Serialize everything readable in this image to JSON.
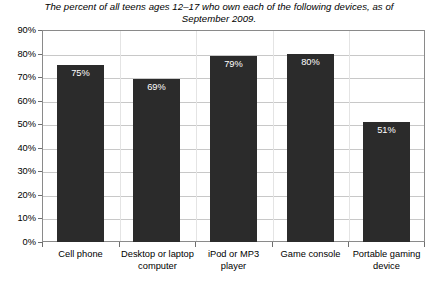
{
  "chart_data": {
    "type": "bar",
    "title": "The percent of all teens ages 12–17 who own each of the following devices, as of September 2009.",
    "xlabel": "",
    "ylabel": "",
    "ylim": [
      0,
      90
    ],
    "ytick_step": 10,
    "grid": true,
    "legend": "none",
    "orientation": "vertical",
    "bar_color": "#2b2b2b",
    "value_label_color": "#ffffff",
    "categories": [
      "Cell phone",
      "Desktop or laptop computer",
      "iPod or MP3 player",
      "Game console",
      "Portable gaming device"
    ],
    "values": [
      75,
      69,
      79,
      80,
      51
    ],
    "value_labels": [
      "75%",
      "69%",
      "79%",
      "80%",
      "51%"
    ],
    "ytick_labels": [
      "0%",
      "10%",
      "20%",
      "30%",
      "40%",
      "50%",
      "60%",
      "70%",
      "80%",
      "90%"
    ],
    "ytick_values": [
      0,
      10,
      20,
      30,
      40,
      50,
      60,
      70,
      80,
      90
    ]
  },
  "axis": {
    "y": {
      "labels": [
        "90%",
        "80%",
        "70%",
        "60%",
        "50%",
        "40%",
        "30%",
        "20%",
        "10%",
        "0%"
      ]
    },
    "x": {
      "labels": [
        "Cell phone",
        "Desktop or laptop computer",
        "iPod or MP3 player",
        "Game console",
        "Portable gaming device"
      ]
    }
  },
  "bars": [
    {
      "label": "Cell phone",
      "value": 75,
      "value_label": "75%"
    },
    {
      "label": "Desktop or laptop computer",
      "value": 69,
      "value_label": "69%"
    },
    {
      "label": "iPod or MP3 player",
      "value": 79,
      "value_label": "79%"
    },
    {
      "label": "Game console",
      "value": 80,
      "value_label": "80%"
    },
    {
      "label": "Portable gaming device",
      "value": 51,
      "value_label": "51%"
    }
  ],
  "colors": {
    "bar": "#2b2b2b",
    "grid": "#c8c8c8",
    "frame": "#8a8a8a",
    "text": "#000000",
    "value_text": "#ffffff",
    "background": "#ffffff"
  }
}
